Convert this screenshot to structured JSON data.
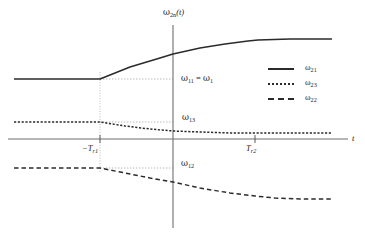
{
  "figure": {
    "background": "#ffffff",
    "ink": "#2b2b2b",
    "axis_color": "#6f6f6f",
    "guide_color": "#9a9a9a"
  },
  "axes": {
    "y_label": "ω2n(t)",
    "y_label_parts": {
      "omega": "ω",
      "sub": "2n",
      "arg": "(t)"
    },
    "x_label": "t",
    "x_ticks": [
      {
        "id": "tr1",
        "label": "−Tr1",
        "label_parts": {
          "main": "−T",
          "sub": "r1"
        },
        "x_px": 100
      },
      {
        "id": "tr2",
        "label": "Tr2",
        "label_parts": {
          "main": "T",
          "sub": "r2"
        },
        "x_px": 255
      }
    ],
    "origin_px": {
      "x": 173,
      "y": 139
    },
    "x_axis_span_px": {
      "x1": 8,
      "x2": 348,
      "y": 139
    },
    "y_axis_span_px": {
      "x": 173,
      "y1": 25,
      "y2": 228
    }
  },
  "annotations": [
    {
      "id": "w11",
      "text": "ω11 = ω1",
      "parts": {
        "o1": "ω",
        "s1": "11",
        "eq": " = ",
        "o2": "ω",
        "s2": "1"
      },
      "y_px": 79
    },
    {
      "id": "w13",
      "text": "ω13",
      "parts": {
        "o1": "ω",
        "s1": "13"
      },
      "y_px": 122
    },
    {
      "id": "w12",
      "text": "ω12",
      "parts": {
        "o1": "ω",
        "s1": "12"
      },
      "y_px": 168
    }
  ],
  "legend": {
    "position": "top-right",
    "entries": [
      {
        "id": "w21",
        "label": "ω21",
        "parts": {
          "o": "ω",
          "s": "21"
        },
        "style": "solid"
      },
      {
        "id": "w23",
        "label": "ω23",
        "parts": {
          "o": "ω",
          "s": "23"
        },
        "style": "dotted"
      },
      {
        "id": "w22",
        "label": "ω22",
        "parts": {
          "o": "ω",
          "s": "22"
        },
        "style": "dashed"
      }
    ]
  },
  "chart_data": {
    "type": "line",
    "title": "",
    "xlabel": "t",
    "ylabel": "ω2n(t)",
    "xlim": [
      -1.05,
      1.05
    ],
    "ylim": [
      -0.55,
      0.9
    ],
    "grid": false,
    "legend_position": "top-right",
    "x_tick_values": [
      -0.45,
      0.48
    ],
    "x_tick_labels": [
      "−Tr1",
      "Tr2"
    ],
    "reference_levels": [
      {
        "name": "ω11 = ω1",
        "value_px_y": 79
      },
      {
        "name": "ω13",
        "value_px_y": 122
      },
      {
        "name": "ω12",
        "value_px_y": 168
      }
    ],
    "series": [
      {
        "name": "ω21",
        "style": "solid",
        "color": "#2b2b2b",
        "points_px": [
          [
            14,
            79
          ],
          [
            100,
            79
          ],
          [
            130,
            67
          ],
          [
            160,
            58
          ],
          [
            173,
            54
          ],
          [
            200,
            48
          ],
          [
            225,
            44
          ],
          [
            248,
            41
          ],
          [
            258,
            40
          ],
          [
            290,
            39
          ],
          [
            332,
            39
          ]
        ]
      },
      {
        "name": "ω23",
        "style": "dotted",
        "color": "#2b2b2b",
        "points_px": [
          [
            14,
            122
          ],
          [
            100,
            122
          ],
          [
            125,
            126
          ],
          [
            150,
            129
          ],
          [
            173,
            131
          ],
          [
            200,
            132
          ],
          [
            230,
            133
          ],
          [
            255,
            133
          ],
          [
            290,
            133
          ],
          [
            332,
            133
          ]
        ]
      },
      {
        "name": "ω22",
        "style": "dashed",
        "color": "#2b2b2b",
        "points_px": [
          [
            14,
            168
          ],
          [
            100,
            168
          ],
          [
            125,
            173
          ],
          [
            150,
            178
          ],
          [
            173,
            182
          ],
          [
            200,
            188
          ],
          [
            230,
            193
          ],
          [
            255,
            196
          ],
          [
            275,
            198
          ],
          [
            300,
            199
          ],
          [
            332,
            199
          ]
        ]
      }
    ],
    "guides": [
      {
        "type": "vertical",
        "x_px": 100,
        "y1_px": 72,
        "y2_px": 172,
        "style": "dotted"
      },
      {
        "type": "horizontal",
        "y_px": 79,
        "x1_px": 100,
        "x2_px": 173,
        "style": "dotted"
      },
      {
        "type": "horizontal",
        "y_px": 122,
        "x1_px": 100,
        "x2_px": 173,
        "style": "dotted"
      },
      {
        "type": "horizontal",
        "y_px": 168,
        "x1_px": 100,
        "x2_px": 173,
        "style": "dotted"
      }
    ]
  }
}
